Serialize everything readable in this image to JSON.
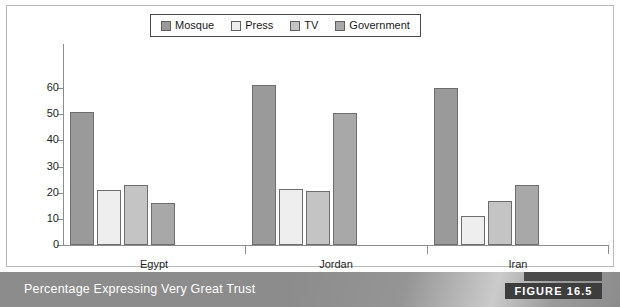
{
  "figure": {
    "caption": "Percentage Expressing Very Great Trust",
    "tag": "FIGURE 16.5"
  },
  "legend": {
    "position": "top-center",
    "items": [
      {
        "label": "Mosque",
        "color": "#9a9a9a"
      },
      {
        "label": "Press",
        "color": "#eeeeee"
      },
      {
        "label": "TV",
        "color": "#c4c4c4"
      },
      {
        "label": "Government",
        "color": "#a8a8a8"
      }
    ]
  },
  "chart_data": {
    "type": "bar",
    "title": "Percentage Expressing Very Great Trust",
    "xlabel": "",
    "ylabel": "",
    "ylim": [
      0,
      60
    ],
    "yticks": [
      0,
      10,
      20,
      30,
      40,
      50,
      60
    ],
    "ytick_labels": [
      "0",
      "10",
      "20",
      "30",
      "40",
      "50",
      "60"
    ],
    "grid": false,
    "legend_position": "top-center",
    "categories": [
      "Egypt",
      "Jordan",
      "Iran"
    ],
    "series": [
      {
        "name": "Mosque",
        "color": "#9a9a9a",
        "values": [
          51,
          61,
          60
        ]
      },
      {
        "name": "Press",
        "color": "#eeeeee",
        "values": [
          21,
          21.5,
          11
        ]
      },
      {
        "name": "TV",
        "color": "#c4c4c4",
        "values": [
          23,
          20.5,
          17
        ]
      },
      {
        "name": "Government",
        "color": "#a8a8a8",
        "values": [
          16,
          50.5,
          23
        ]
      }
    ]
  }
}
